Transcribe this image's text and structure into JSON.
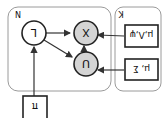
{
  "diagram": {
    "orientation": "rotated 180 degrees",
    "plates": [
      {
        "id": "N",
        "label": "N"
      },
      {
        "id": "K",
        "label": "K"
      }
    ],
    "nodes": [
      {
        "id": "L",
        "label": "L",
        "observed": false
      },
      {
        "id": "X",
        "label": "X",
        "observed": true
      },
      {
        "id": "U",
        "label": "U",
        "observed": true
      }
    ],
    "parameters": [
      {
        "id": "p1",
        "label": "μ,Λ,ψ"
      },
      {
        "id": "p2",
        "label": "μ, Σ"
      },
      {
        "id": "pi",
        "label": "π"
      }
    ],
    "edges": [
      {
        "from": "L",
        "to": "X"
      },
      {
        "from": "L",
        "to": "U"
      },
      {
        "from": "U",
        "to": "X"
      },
      {
        "from": "p1",
        "to": "X"
      },
      {
        "from": "p2",
        "to": "U"
      },
      {
        "from": "pi",
        "to": "L"
      }
    ],
    "colors": {
      "observed_fill": "#d4d4d4",
      "latent_fill": "#ffffff",
      "plate_stroke": "#9a9a9a"
    }
  }
}
